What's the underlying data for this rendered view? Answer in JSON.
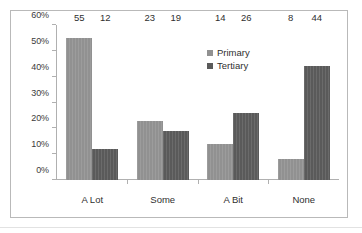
{
  "chart_data": {
    "type": "bar",
    "title": "",
    "subtitle": "",
    "xlabel": "",
    "ylabel": "",
    "categories": [
      "A Lot",
      "Some",
      "A Bit",
      "None"
    ],
    "series": [
      {
        "name": "Primary",
        "color": "#919191",
        "values": [
          55,
          23,
          14,
          8
        ]
      },
      {
        "name": "Tertiary",
        "color": "#5a5a5a",
        "values": [
          12,
          19,
          26,
          44
        ]
      }
    ],
    "value_suffix": "",
    "ylim": [
      0,
      60
    ],
    "ytick_step": 10,
    "ytick_labels": [
      "0%",
      "10%",
      "20%",
      "30%",
      "40%",
      "50%",
      "60%"
    ],
    "ytick_values": [
      0,
      10,
      20,
      30,
      40,
      50,
      60
    ],
    "grid": false,
    "legend_position": "inside-top-right",
    "data_labels": true,
    "frame": true,
    "colors": {
      "primary": "#919191",
      "tertiary": "#5a5a5a",
      "axis": "#b0b0b0",
      "frame": "#b9b9b9",
      "text": "#2f2f2f",
      "background": "#ffffff"
    }
  },
  "legend": {
    "items": [
      {
        "label": "Primary",
        "swatch": "primary"
      },
      {
        "label": "Tertiary",
        "swatch": "tertiary"
      }
    ]
  }
}
